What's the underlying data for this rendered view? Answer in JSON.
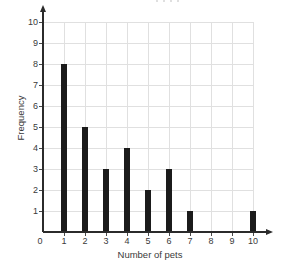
{
  "chart_data": {
    "type": "bar",
    "title": "",
    "xlabel": "Number of pets",
    "ylabel": "Frequency",
    "categories": [
      0,
      1,
      2,
      3,
      4,
      5,
      6,
      7,
      8,
      9,
      10
    ],
    "values": [
      0,
      8,
      5,
      3,
      4,
      2,
      3,
      1,
      0,
      0,
      1
    ],
    "x_ticks": [
      0,
      1,
      2,
      3,
      4,
      5,
      6,
      7,
      8,
      9,
      10
    ],
    "y_ticks": [
      1,
      2,
      3,
      4,
      5,
      6,
      7,
      8,
      9,
      10
    ],
    "xlim": [
      0,
      10
    ],
    "ylim": [
      0,
      10
    ],
    "grid": true,
    "legend": false,
    "bar_color": "#1b1b1b",
    "grid_color": "#e0e0e0",
    "axis_color": "#2b2b2b",
    "tick_color": "#4a4a4a",
    "text_color": "#3a3a3a",
    "background": "#ffffff"
  }
}
